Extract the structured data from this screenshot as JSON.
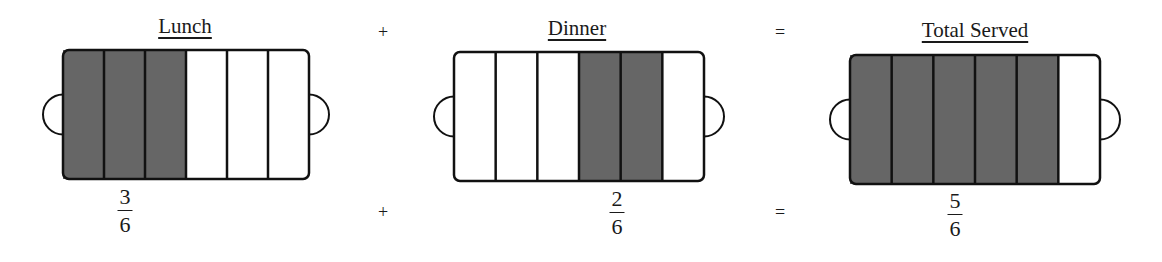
{
  "colors": {
    "shaded": "#666666",
    "empty": "#ffffff",
    "stroke": "#111111"
  },
  "panels": [
    {
      "title": "Lunch",
      "sections": 6,
      "shaded": [
        1,
        2,
        3
      ],
      "fraction": {
        "numerator": "3",
        "denominator": "6"
      }
    },
    {
      "title": "Dinner",
      "sections": 6,
      "shaded": [
        4,
        5
      ],
      "fraction": {
        "numerator": "2",
        "denominator": "6"
      }
    },
    {
      "title": "Total Served",
      "sections": 6,
      "shaded": [
        1,
        2,
        3,
        4,
        5
      ],
      "fraction": {
        "numerator": "5",
        "denominator": "6"
      }
    }
  ],
  "operators": {
    "plus": "+",
    "equals": "="
  }
}
